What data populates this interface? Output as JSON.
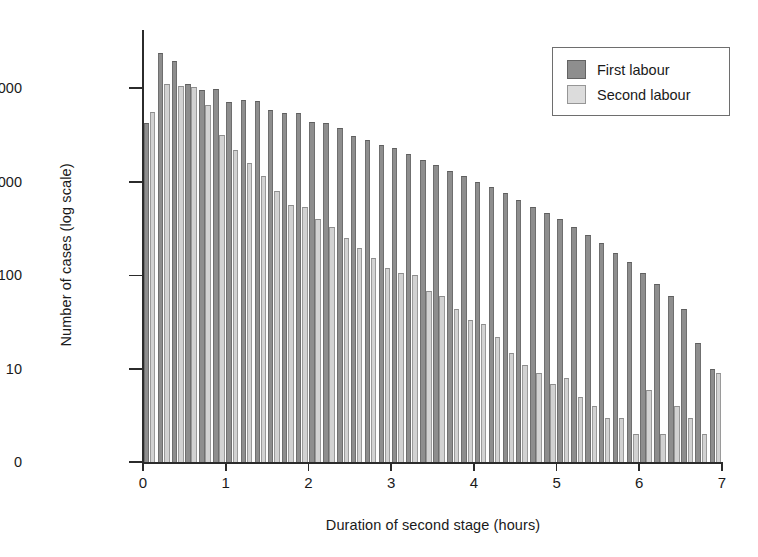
{
  "chart_data": {
    "type": "bar",
    "title": "",
    "xlabel": "Duration of second stage (hours)",
    "ylabel": "Number of cases (log scale)",
    "xlim": [
      0,
      7
    ],
    "ylim": [
      1,
      30000
    ],
    "yscale": "log",
    "grid": false,
    "legend_position": "top-right",
    "bin_width_hours": 0.1667,
    "x_ticks": [
      "0",
      "1",
      "2",
      "3",
      "4",
      "5",
      "6",
      "7"
    ],
    "x_tick_values": [
      0,
      1,
      2,
      3,
      4,
      5,
      6,
      7
    ],
    "y_ticks": [
      "0",
      "10",
      "100",
      "1000",
      "10 000"
    ],
    "y_tick_values": [
      0,
      10,
      100,
      1000,
      10000
    ],
    "colors": {
      "first": "#8e8e8e",
      "second": "#d2d2d2",
      "axis": "#2b2b2b"
    },
    "x": [
      0.08,
      0.25,
      0.42,
      0.58,
      0.75,
      0.92,
      1.08,
      1.25,
      1.42,
      1.58,
      1.75,
      1.92,
      2.08,
      2.25,
      2.42,
      2.58,
      2.75,
      2.92,
      3.08,
      3.25,
      3.42,
      3.58,
      3.75,
      3.92,
      4.08,
      4.25,
      4.42,
      4.58,
      4.75,
      4.92,
      5.08,
      5.25,
      5.42,
      5.58,
      5.75,
      5.92,
      6.08,
      6.25,
      6.42,
      6.58,
      6.75,
      6.92
    ],
    "series": [
      {
        "name": "First labour",
        "color": "#8e8e8e",
        "values": [
          4200,
          24000,
          19500,
          11200,
          9500,
          9700,
          7200,
          7500,
          7300,
          5800,
          5400,
          5500,
          4400,
          4200,
          3800,
          3100,
          2800,
          2500,
          2300,
          2000,
          1700,
          1500,
          1300,
          1150,
          1000,
          880,
          760,
          640,
          540,
          470,
          400,
          330,
          270,
          220,
          175,
          140,
          105,
          80,
          60,
          44,
          19,
          10
        ]
      },
      {
        "name": "Second labour",
        "color": "#d2d2d2",
        "values": [
          5600,
          11000,
          10500,
          10300,
          6600,
          3200,
          2200,
          1600,
          1150,
          800,
          560,
          540,
          400,
          330,
          250,
          195,
          155,
          120,
          105,
          100,
          68,
          60,
          44,
          33,
          30,
          22,
          15,
          11,
          9,
          7,
          8,
          5,
          4,
          3,
          3,
          2,
          6,
          2,
          4,
          3,
          2,
          9
        ]
      }
    ]
  },
  "legend": {
    "items": [
      {
        "label": "First labour",
        "swatch": "first"
      },
      {
        "label": "Second labour",
        "swatch": "second"
      }
    ]
  }
}
